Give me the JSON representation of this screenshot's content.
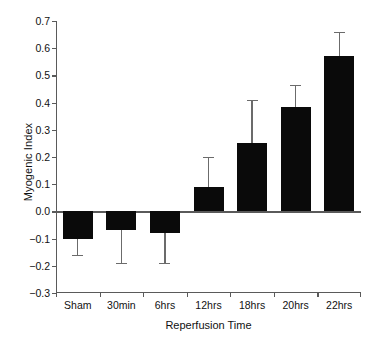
{
  "chart_data": {
    "type": "bar",
    "title": "",
    "xlabel": "Reperfusion Time",
    "ylabel": "Myogenic Index",
    "categories": [
      "Sham",
      "30min",
      "6hrs",
      "12hrs",
      "18hrs",
      "20hrs",
      "22hrs"
    ],
    "values": [
      -0.1,
      -0.07,
      -0.08,
      0.09,
      0.25,
      0.385,
      0.57
    ],
    "errors": [
      0.06,
      0.12,
      0.11,
      0.11,
      0.16,
      0.08,
      0.09
    ],
    "error_direction": [
      "down",
      "down",
      "down",
      "up",
      "up",
      "up",
      "up"
    ],
    "ylim": [
      -0.3,
      0.7
    ],
    "yticks": [
      0.7,
      0.6,
      0.5,
      0.4,
      0.3,
      0.2,
      0.1,
      0.0,
      -0.1,
      -0.2,
      -0.3
    ],
    "ytick_labels": [
      "0.7",
      "0.6",
      "0.5",
      "0.4",
      "0.3",
      "0.2",
      "0.1",
      "0.0",
      "−0.1",
      "−0.2",
      "−0.3"
    ],
    "grid": false,
    "legend": null,
    "bar_color": "#0a0a0a",
    "error_color": "#6b6b6b",
    "axis_color": "#5a5a5a",
    "background": "#ffffff",
    "zero_baseline": 0.0
  },
  "axes": {
    "ylabel_text": "Myogenic Index",
    "xlabel_text": "Reperfusion Time"
  }
}
